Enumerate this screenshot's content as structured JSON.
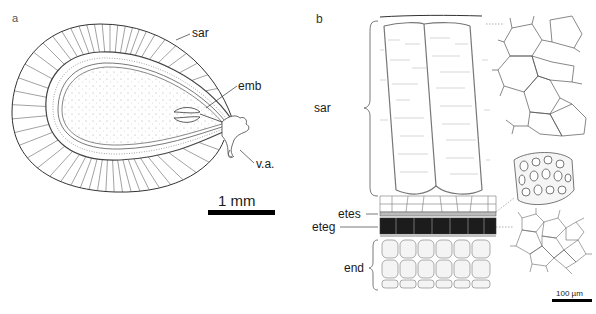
{
  "figure": {
    "panels": [
      {
        "id": "a",
        "letter": "a",
        "description": "Longitudinal section of seed",
        "labels": {
          "sar": "sar",
          "emb": "emb",
          "va": "v.a."
        },
        "scale_bar": {
          "label": "1 mm"
        }
      },
      {
        "id": "b",
        "letter": "b",
        "description": "Seed coat layers in detail with surface views",
        "labels": {
          "sar": "sar",
          "etes": "etes",
          "eteg": "eteg",
          "end": "end"
        },
        "scale_bar": {
          "label": "100 µm"
        }
      }
    ],
    "colors": {
      "line": "#333333",
      "stipple": "#888888",
      "eteg_fill": "#1c1c1c",
      "scale_bar": "#000000"
    }
  }
}
